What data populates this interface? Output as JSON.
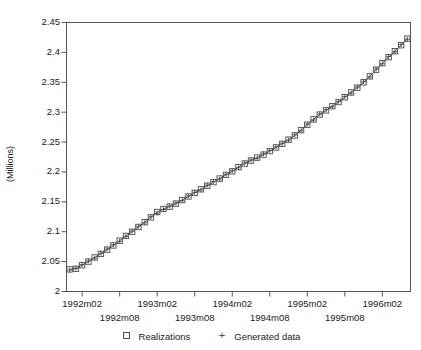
{
  "chart_data": {
    "type": "scatter",
    "title": "",
    "xlabel": "",
    "ylabel": "(Millions)",
    "ylim": [
      2,
      2.45
    ],
    "yticks": [
      2,
      2.05,
      2.1,
      2.15,
      2.2,
      2.25,
      2.3,
      2.35,
      2.4,
      2.45
    ],
    "ytick_labels": [
      "2",
      "2.05",
      "2.1",
      "2.15",
      "2.2",
      "2.25",
      "2.3",
      "2.35",
      "2.4",
      "2.45"
    ],
    "grid": false,
    "legend_position": "below-axis",
    "xtick_labels_upper": [
      "1992m02",
      "1993m02",
      "1994m02",
      "1995m02",
      "1996m02"
    ],
    "xtick_labels_lower": [
      "1992m08",
      "1993m08",
      "1994m08",
      "1995m08"
    ],
    "xlim": [
      "1991m12",
      "1996m06"
    ],
    "x": [
      "1991m12",
      "1992m01",
      "1992m02",
      "1992m03",
      "1992m04",
      "1992m05",
      "1992m06",
      "1992m07",
      "1992m08",
      "1992m09",
      "1992m10",
      "1992m11",
      "1992m12",
      "1993m01",
      "1993m02",
      "1993m03",
      "1993m04",
      "1993m05",
      "1993m06",
      "1993m07",
      "1993m08",
      "1993m09",
      "1993m10",
      "1993m11",
      "1993m12",
      "1994m01",
      "1994m02",
      "1994m03",
      "1994m04",
      "1994m05",
      "1994m06",
      "1994m07",
      "1994m08",
      "1994m09",
      "1994m10",
      "1994m11",
      "1994m12",
      "1995m01",
      "1995m02",
      "1995m03",
      "1995m04",
      "1995m05",
      "1995m06",
      "1995m07",
      "1995m08",
      "1995m09",
      "1995m10",
      "1995m11",
      "1995m12",
      "1996m01",
      "1996m02",
      "1996m03",
      "1996m04",
      "1996m05",
      "1996m06"
    ],
    "series": [
      {
        "name": "Realizations",
        "marker": "square",
        "color": "#4a4a4a",
        "values": [
          2.037,
          2.038,
          2.044,
          2.05,
          2.057,
          2.063,
          2.07,
          2.077,
          2.085,
          2.093,
          2.1,
          2.108,
          2.116,
          2.124,
          2.133,
          2.138,
          2.142,
          2.147,
          2.153,
          2.159,
          2.165,
          2.171,
          2.177,
          2.183,
          2.189,
          2.195,
          2.201,
          2.208,
          2.214,
          2.219,
          2.224,
          2.229,
          2.235,
          2.241,
          2.247,
          2.254,
          2.261,
          2.27,
          2.279,
          2.288,
          2.296,
          2.303,
          2.31,
          2.317,
          2.325,
          2.333,
          2.341,
          2.35,
          2.36,
          2.371,
          2.382,
          2.392,
          2.402,
          2.412,
          2.423
        ]
      },
      {
        "name": "Generated data",
        "marker": "plus",
        "color": "#4a4a4a",
        "values": [
          2.036,
          2.039,
          2.045,
          2.051,
          2.056,
          2.064,
          2.071,
          2.078,
          2.084,
          2.092,
          2.101,
          2.109,
          2.115,
          2.125,
          2.131,
          2.137,
          2.143,
          2.148,
          2.152,
          2.16,
          2.166,
          2.17,
          2.178,
          2.184,
          2.188,
          2.196,
          2.202,
          2.207,
          2.215,
          2.22,
          2.223,
          2.23,
          2.236,
          2.242,
          2.248,
          2.253,
          2.262,
          2.269,
          2.28,
          2.287,
          2.297,
          2.304,
          2.309,
          2.318,
          2.326,
          2.332,
          2.342,
          2.351,
          2.359,
          2.372,
          2.381,
          2.393,
          2.401,
          2.413,
          2.422
        ]
      }
    ]
  },
  "legend": {
    "entries": [
      {
        "label": "Realizations",
        "marker": "square"
      },
      {
        "label": "Generated data",
        "marker": "plus"
      }
    ]
  }
}
